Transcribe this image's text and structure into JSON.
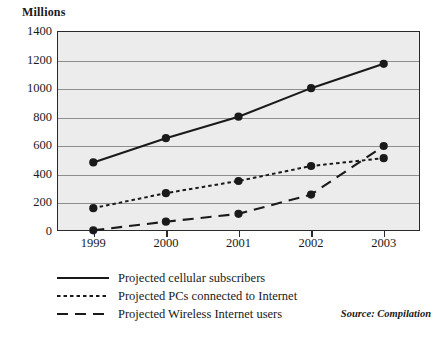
{
  "chart_data": {
    "type": "line",
    "title": "",
    "ylabel": "Millions",
    "xlabel": "",
    "categories": [
      "1999",
      "2000",
      "2001",
      "2002",
      "2003"
    ],
    "ylim": [
      0,
      1400
    ],
    "ytick_labels": [
      "0",
      "200",
      "400",
      "600",
      "800",
      "1000",
      "1200",
      "1400"
    ],
    "ytick_values": [
      0,
      200,
      400,
      600,
      800,
      1000,
      1200,
      1400
    ],
    "grid": true,
    "legend_position": "below-plot",
    "series": [
      {
        "name": "Projected cellular subscribers",
        "style": "solid",
        "color": "#1a1a1a",
        "values": [
          480,
          650,
          800,
          1000,
          1170
        ]
      },
      {
        "name": "Projected PCs connected to Internet",
        "style": "dotted",
        "color": "#1a1a1a",
        "values": [
          160,
          265,
          350,
          455,
          510
        ]
      },
      {
        "name": "Projected Wireless Internet users",
        "style": "dashed",
        "color": "#1a1a1a",
        "values": [
          5,
          65,
          120,
          255,
          595
        ]
      }
    ]
  },
  "figure": {
    "unit_label": "Millions",
    "source_note": "Source: Compilation",
    "plot_background": "#ececec",
    "grid_color": "#8e8e8e",
    "axis_color": "#2a2a2a"
  },
  "legend": {
    "items": [
      {
        "label": "Projected cellular subscribers",
        "style": "solid"
      },
      {
        "label": "Projected PCs connected to Internet",
        "style": "dotted"
      },
      {
        "label": "Projected Wireless Internet users",
        "style": "dashed"
      }
    ]
  }
}
